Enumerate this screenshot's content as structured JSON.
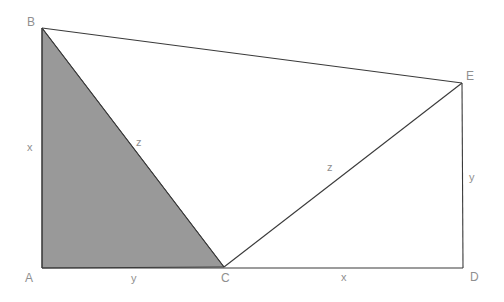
{
  "figure": {
    "canvas": {
      "width": 504,
      "height": 302
    },
    "background_color": "#ffffff",
    "stroke_color": "#3a3a3a",
    "shade_color": "#999999",
    "label_color": "#8f8f8f"
  },
  "vertices": [
    {
      "id": "A",
      "label": "A",
      "x": 42,
      "y": 268,
      "label_x": 25,
      "label_y": 272
    },
    {
      "id": "B",
      "label": "B",
      "x": 42,
      "y": 28,
      "label_x": 27,
      "label_y": 16
    },
    {
      "id": "C",
      "label": "C",
      "x": 224,
      "y": 267,
      "label_x": 221,
      "label_y": 272
    },
    {
      "id": "D",
      "label": "D",
      "x": 463,
      "y": 268,
      "label_x": 470,
      "label_y": 271
    },
    {
      "id": "E",
      "label": "E",
      "x": 462,
      "y": 83,
      "label_x": 466,
      "label_y": 70
    }
  ],
  "segments": [
    {
      "id": "AB",
      "from": "A",
      "to": "B"
    },
    {
      "id": "BE",
      "from": "B",
      "to": "E"
    },
    {
      "id": "ED",
      "from": "E",
      "to": "D"
    },
    {
      "id": "AD",
      "from": "A",
      "to": "D"
    },
    {
      "id": "BC",
      "from": "B",
      "to": "C"
    },
    {
      "id": "CE",
      "from": "C",
      "to": "E"
    }
  ],
  "shaded_region": {
    "id": "triangle-ABC",
    "vertices": [
      "A",
      "B",
      "C"
    ],
    "fill": "#999999"
  },
  "side_labels": [
    {
      "id": "AB",
      "text": "x",
      "x": 27,
      "y": 142
    },
    {
      "id": "AC",
      "text": "y",
      "x": 131,
      "y": 273
    },
    {
      "id": "BC",
      "text": "z",
      "x": 136,
      "y": 137
    },
    {
      "id": "CE",
      "text": "z",
      "x": 327,
      "y": 162
    },
    {
      "id": "CD",
      "text": "x",
      "x": 341,
      "y": 272
    },
    {
      "id": "ED",
      "text": "y",
      "x": 469,
      "y": 172
    }
  ]
}
